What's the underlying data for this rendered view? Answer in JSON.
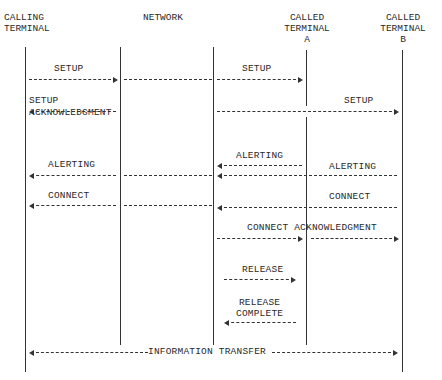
{
  "diagram": {
    "type": "sequence",
    "participants": [
      {
        "id": "calling",
        "label": "CALLING\nTERMINAL"
      },
      {
        "id": "network",
        "label": "NETWORK"
      },
      {
        "id": "called_a",
        "label": "CALLED\nTERMINAL\nA"
      },
      {
        "id": "called_b",
        "label": "CALLED\nTERMINAL\nB"
      }
    ],
    "messages": [
      {
        "label": "SETUP",
        "from": "calling",
        "to": "network"
      },
      {
        "label": "SETUP",
        "from": "network",
        "to": "called_a"
      },
      {
        "label": "SETUP",
        "from": "network",
        "to": "called_b"
      },
      {
        "label": "SETUP\nACKNOWLEDGMENT",
        "from": "network",
        "to": "calling"
      },
      {
        "label": "ALERTING",
        "from": "called_a",
        "to": "network"
      },
      {
        "label": "ALERTING",
        "from": "called_b",
        "to": "network"
      },
      {
        "label": "ALERTING",
        "from": "network",
        "to": "calling"
      },
      {
        "label": "CONNECT",
        "from": "called_b",
        "to": "network"
      },
      {
        "label": "CONNECT",
        "from": "network",
        "to": "calling"
      },
      {
        "label": "CONNECT ACKNOWLEDGMENT",
        "from": "network",
        "to": "called_b"
      },
      {
        "label": "RELEASE",
        "from": "network",
        "to": "called_a"
      },
      {
        "label": "RELEASE\nCOMPLETE",
        "from": "called_a",
        "to": "network"
      },
      {
        "label": "INFORMATION TRANSFER",
        "from": "calling",
        "to": "called_b",
        "bidirectional": true
      }
    ]
  },
  "labels": {
    "calling": "CALLING\nTERMINAL",
    "network": "NETWORK",
    "called_a": "CALLED\nTERMINAL\nA",
    "called_b": "CALLED\nTERMINAL\nB",
    "setup": "SETUP",
    "setup_ack": "SETUP\nACKNOWLEDGMENT",
    "alerting": "ALERTING",
    "connect": "CONNECT",
    "connect_ack": "CONNECT ACKNOWLEDGMENT",
    "release": "RELEASE",
    "release_complete": "RELEASE\nCOMPLETE",
    "info_transfer": "INFORMATION TRANSFER"
  }
}
